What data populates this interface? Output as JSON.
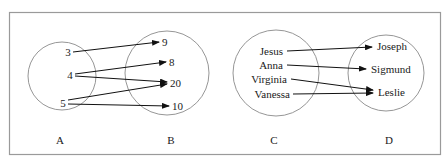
{
  "diagrams": [
    {
      "id": "left",
      "domain_set": {
        "label": "A",
        "elements": [
          "3",
          "4",
          "5"
        ]
      },
      "codomain_set": {
        "label": "B",
        "elements": [
          "9",
          "8",
          "20",
          "10"
        ]
      },
      "mappings": [
        {
          "from": "3",
          "to": "9"
        },
        {
          "from": "4",
          "to": "8"
        },
        {
          "from": "4",
          "to": "20"
        },
        {
          "from": "5",
          "to": "20"
        },
        {
          "from": "5",
          "to": "10"
        }
      ]
    },
    {
      "id": "right",
      "domain_set": {
        "label": "C",
        "elements": [
          "Jesus",
          "Anna",
          "Virginia",
          "Vanessa"
        ]
      },
      "codomain_set": {
        "label": "D",
        "elements": [
          "Joseph",
          "Sigmund",
          "Leslie"
        ]
      },
      "mappings": [
        {
          "from": "Jesus",
          "to": "Joseph"
        },
        {
          "from": "Anna",
          "to": "Sigmund"
        },
        {
          "from": "Virginia",
          "to": "Leslie"
        },
        {
          "from": "Vanessa",
          "to": "Leslie"
        }
      ]
    }
  ],
  "colors": {
    "frame": "#9a9a9a",
    "circle": "#8a8a8a",
    "arrow": "#111111",
    "text": "#1a1a1a"
  }
}
